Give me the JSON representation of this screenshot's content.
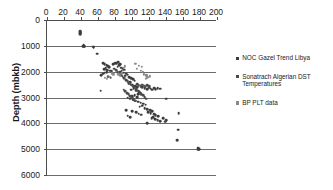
{
  "chart_data": {
    "type": "scatter",
    "title": "",
    "xlabel": "",
    "ylabel": "Depth (mbkb)",
    "xlim": [
      0,
      200
    ],
    "ylim": [
      0,
      6000
    ],
    "y_inverted": true,
    "x_axis_position": "top",
    "grid": "horizontal",
    "legend_position": "right",
    "xticks": [
      0,
      20,
      40,
      60,
      80,
      100,
      120,
      140,
      160,
      180,
      200
    ],
    "yticks": [
      0,
      1000,
      2000,
      3000,
      4000,
      5000,
      6000
    ],
    "xtick_labels": [
      "0",
      "20",
      "40",
      "60",
      "80",
      "100",
      "120",
      "140",
      "160",
      "180",
      "200"
    ],
    "ytick_labels": [
      "0",
      "1000",
      "2000",
      "3000",
      "4000",
      "5000",
      "6000"
    ],
    "series": [
      {
        "name": "NOC Gazel Trend Libya",
        "color": "#3c3c3c",
        "marker": "circle",
        "points": [
          [
            39,
            440
          ],
          [
            39,
            470
          ],
          [
            39,
            505
          ],
          [
            39,
            540
          ],
          [
            43,
            960
          ],
          [
            44,
            1000
          ],
          [
            44,
            1035
          ],
          [
            42,
            1010
          ],
          [
            54,
            1030
          ],
          [
            55,
            1060
          ],
          [
            59,
            1300
          ],
          [
            66,
            1660
          ],
          [
            68,
            1700
          ],
          [
            70,
            1740
          ],
          [
            72,
            1780
          ],
          [
            73,
            1820
          ],
          [
            69,
            1860
          ],
          [
            67,
            1900
          ],
          [
            71,
            1930
          ],
          [
            74,
            1960
          ],
          [
            76,
            1990
          ],
          [
            70,
            2010
          ],
          [
            68,
            2040
          ],
          [
            66,
            2080
          ],
          [
            64,
            2140
          ],
          [
            72,
            2190
          ],
          [
            75,
            2230
          ],
          [
            78,
            1710
          ],
          [
            80,
            1680
          ],
          [
            82,
            1660
          ],
          [
            84,
            1640
          ],
          [
            86,
            1700
          ],
          [
            85,
            1760
          ],
          [
            83,
            1800
          ],
          [
            87,
            1840
          ],
          [
            89,
            1880
          ],
          [
            91,
            1920
          ],
          [
            88,
            1960
          ],
          [
            86,
            2000
          ],
          [
            90,
            2040
          ],
          [
            93,
            2080
          ],
          [
            95,
            2120
          ],
          [
            92,
            2160
          ],
          [
            63,
            2740
          ],
          [
            97,
            2200
          ],
          [
            99,
            2250
          ],
          [
            101,
            2300
          ],
          [
            103,
            2350
          ],
          [
            98,
            2400
          ],
          [
            96,
            2450
          ],
          [
            100,
            2500
          ],
          [
            104,
            2550
          ],
          [
            106,
            2600
          ],
          [
            102,
            2650
          ],
          [
            99,
            2700
          ],
          [
            105,
            2740
          ],
          [
            108,
            2780
          ],
          [
            110,
            2820
          ],
          [
            107,
            2860
          ],
          [
            103,
            2900
          ],
          [
            100,
            2940
          ],
          [
            106,
            2980
          ],
          [
            112,
            2600
          ],
          [
            115,
            2640
          ],
          [
            118,
            2680
          ],
          [
            120,
            2620
          ],
          [
            122,
            2660
          ],
          [
            124,
            2700
          ],
          [
            126,
            2640
          ],
          [
            128,
            2680
          ],
          [
            130,
            2650
          ],
          [
            133,
            2660
          ],
          [
            95,
            3000
          ],
          [
            98,
            3040
          ],
          [
            101,
            3080
          ],
          [
            104,
            3120
          ],
          [
            107,
            3160
          ],
          [
            110,
            3200
          ],
          [
            113,
            3240
          ],
          [
            116,
            3280
          ],
          [
            112,
            3320
          ],
          [
            109,
            3360
          ],
          [
            115,
            3400
          ],
          [
            118,
            3440
          ],
          [
            121,
            3480
          ],
          [
            124,
            3520
          ],
          [
            119,
            3560
          ],
          [
            122,
            3600
          ],
          [
            126,
            3640
          ],
          [
            128,
            3680
          ],
          [
            131,
            3720
          ],
          [
            125,
            3760
          ],
          [
            123,
            3800
          ],
          [
            127,
            3840
          ],
          [
            130,
            3880
          ],
          [
            133,
            3920
          ],
          [
            137,
            3800
          ],
          [
            140,
            3870
          ],
          [
            139,
            3930
          ],
          [
            118,
            3980
          ],
          [
            93,
            3480
          ],
          [
            100,
            3540
          ],
          [
            105,
            3580
          ],
          [
            108,
            3620
          ],
          [
            111,
            3660
          ],
          [
            95,
            3700
          ],
          [
            98,
            3760
          ],
          [
            140,
            3050
          ],
          [
            155,
            3600
          ],
          [
            154,
            4240
          ],
          [
            153,
            4640
          ],
          [
            178,
            4950
          ],
          [
            179,
            4990
          ],
          [
            178,
            5020
          ]
        ]
      },
      {
        "name": "Sonatrach Algerian DST Temperatures",
        "color": "#4a4a4a",
        "marker": "circle",
        "points": [
          [
            79,
            1880
          ],
          [
            81,
            1940
          ],
          [
            83,
            2010
          ],
          [
            85,
            2070
          ],
          [
            87,
            2130
          ],
          [
            89,
            2190
          ],
          [
            91,
            2260
          ],
          [
            93,
            2320
          ],
          [
            95,
            2380
          ],
          [
            97,
            2440
          ],
          [
            99,
            2500
          ],
          [
            101,
            2560
          ],
          [
            103,
            2620
          ],
          [
            105,
            2680
          ],
          [
            107,
            2740
          ],
          [
            109,
            2800
          ],
          [
            111,
            2860
          ],
          [
            113,
            2920
          ],
          [
            115,
            2980
          ],
          [
            117,
            3040
          ],
          [
            90,
            2700
          ],
          [
            92,
            2760
          ],
          [
            94,
            2820
          ],
          [
            96,
            2880
          ],
          [
            98,
            2940
          ],
          [
            100,
            3000
          ],
          [
            102,
            3060
          ],
          [
            104,
            3120
          ],
          [
            106,
            2480
          ],
          [
            108,
            2520
          ],
          [
            110,
            2560
          ],
          [
            112,
            2500
          ],
          [
            114,
            2540
          ],
          [
            116,
            2580
          ],
          [
            118,
            2520
          ],
          [
            120,
            2560
          ]
        ]
      },
      {
        "name": "BP PLT data",
        "color": "#8a8a8a",
        "marker": "circle",
        "points": [
          [
            68,
            2240
          ],
          [
            70,
            2280
          ],
          [
            72,
            2160
          ],
          [
            74,
            2200
          ],
          [
            84,
            2100
          ],
          [
            86,
            2140
          ],
          [
            88,
            2060
          ],
          [
            104,
            1700
          ],
          [
            108,
            1780
          ],
          [
            112,
            1820
          ],
          [
            106,
            1900
          ],
          [
            110,
            1960
          ],
          [
            113,
            2000
          ],
          [
            114,
            2100
          ],
          [
            117,
            2140
          ],
          [
            121,
            2180
          ],
          [
            90,
            1840
          ],
          [
            92,
            1790
          ],
          [
            76,
            2060
          ],
          [
            78,
            2100
          ],
          [
            118,
            2220
          ],
          [
            116,
            2280
          ]
        ]
      }
    ]
  },
  "legend": {
    "entries": [
      {
        "label": "NOC Gazel Trend Libya",
        "color": "#3c3c3c"
      },
      {
        "label": "Sonatrach Algerian DST Temperatures",
        "color": "#4a4a4a"
      },
      {
        "label": "BP PLT data",
        "color": "#8a8a8a"
      }
    ]
  },
  "axes": {
    "y_title": "Depth (mbkb)"
  }
}
